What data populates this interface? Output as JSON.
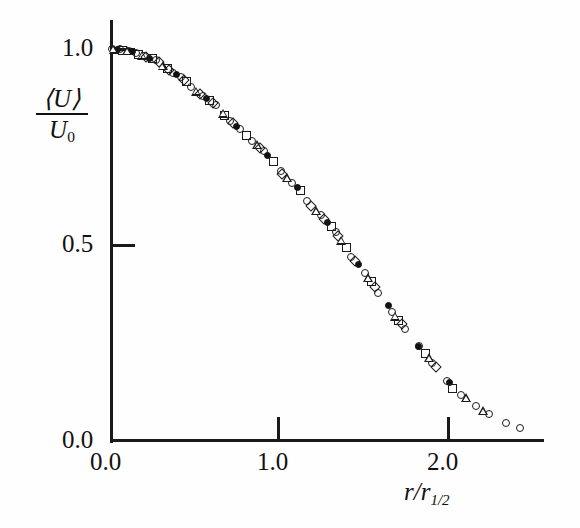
{
  "figure": {
    "kind": "scatter-plot",
    "background": "#fefefe",
    "ink_color": "#1a1a1a"
  },
  "axes": {
    "x_title": "r/r",
    "x_title_sub": "1/2",
    "y_title_numerator": "⟨U⟩",
    "y_title_denominator": "U",
    "y_title_den_sub": "0",
    "x_ticks": [
      "0.0",
      "1.0",
      "2.0"
    ],
    "y_ticks": [
      "0.0",
      "0.5",
      "1.0"
    ]
  },
  "chart_data": {
    "type": "scatter",
    "title": "",
    "xlabel": "r/r_1/2",
    "ylabel": "<U>/U_0",
    "xlim": [
      0.0,
      2.5
    ],
    "ylim": [
      0.0,
      1.05
    ],
    "grid": false,
    "legend": "none",
    "x_ticks": [
      0.0,
      1.0,
      2.0
    ],
    "y_ticks": [
      0.0,
      0.5,
      1.0
    ],
    "series": [
      {
        "name": "open-circle",
        "marker": "circle-open",
        "points": [
          [
            0.0,
            1.0
          ],
          [
            0.05,
            0.999
          ],
          [
            0.1,
            0.995
          ],
          [
            0.14,
            0.99
          ],
          [
            0.19,
            0.982
          ],
          [
            0.26,
            0.973
          ],
          [
            0.36,
            0.94
          ],
          [
            0.41,
            0.928
          ],
          [
            0.47,
            0.902
          ],
          [
            0.54,
            0.88
          ],
          [
            0.62,
            0.857
          ],
          [
            0.7,
            0.817
          ],
          [
            0.76,
            0.795
          ],
          [
            0.83,
            0.766
          ],
          [
            0.9,
            0.74
          ],
          [
            1.0,
            0.688
          ],
          [
            1.07,
            0.659
          ],
          [
            1.16,
            0.612
          ],
          [
            1.24,
            0.576
          ],
          [
            1.33,
            0.532
          ],
          [
            1.42,
            0.47
          ],
          [
            1.5,
            0.428
          ],
          [
            1.58,
            0.378
          ],
          [
            1.66,
            0.33
          ],
          [
            1.74,
            0.286
          ],
          [
            1.82,
            0.243
          ],
          [
            1.9,
            0.198
          ],
          [
            1.99,
            0.152
          ],
          [
            2.07,
            0.118
          ],
          [
            2.16,
            0.09
          ],
          [
            2.24,
            0.068
          ],
          [
            2.34,
            0.046
          ],
          [
            2.42,
            0.033
          ]
        ]
      },
      {
        "name": "filled-circle",
        "marker": "circle-fill",
        "points": [
          [
            0.03,
            0.999
          ],
          [
            0.12,
            0.993
          ],
          [
            0.22,
            0.977
          ],
          [
            0.38,
            0.934
          ],
          [
            0.56,
            0.874
          ],
          [
            0.74,
            0.802
          ],
          [
            0.92,
            0.729
          ],
          [
            1.1,
            0.646
          ],
          [
            1.28,
            0.558
          ],
          [
            1.46,
            0.451
          ],
          [
            1.64,
            0.346
          ],
          [
            1.82,
            0.24
          ],
          [
            2.0,
            0.148
          ]
        ]
      },
      {
        "name": "open-square",
        "marker": "square-open",
        "points": [
          [
            0.06,
            0.997
          ],
          [
            0.16,
            0.987
          ],
          [
            0.24,
            0.975
          ],
          [
            0.33,
            0.95
          ],
          [
            0.44,
            0.916
          ],
          [
            0.58,
            0.868
          ],
          [
            0.67,
            0.83
          ],
          [
            0.8,
            0.78
          ],
          [
            0.96,
            0.712
          ],
          [
            1.12,
            0.64
          ],
          [
            1.3,
            0.548
          ],
          [
            1.39,
            0.494
          ],
          [
            1.54,
            0.406
          ],
          [
            1.7,
            0.308
          ],
          [
            1.86,
            0.222
          ],
          [
            2.02,
            0.133
          ]
        ]
      },
      {
        "name": "open-triangle",
        "marker": "triangle-open",
        "points": [
          [
            0.01,
            1.0
          ],
          [
            0.09,
            0.996
          ],
          [
            0.18,
            0.984
          ],
          [
            0.3,
            0.958
          ],
          [
            0.5,
            0.892
          ],
          [
            0.66,
            0.836
          ],
          [
            0.86,
            0.756
          ],
          [
            1.04,
            0.672
          ],
          [
            1.21,
            0.588
          ],
          [
            1.36,
            0.512
          ],
          [
            1.52,
            0.417
          ],
          [
            1.68,
            0.318
          ],
          [
            1.88,
            0.212
          ],
          [
            2.1,
            0.11
          ],
          [
            2.2,
            0.078
          ]
        ]
      },
      {
        "name": "open-diamond",
        "marker": "diamond-open",
        "points": [
          [
            0.2,
            0.98
          ],
          [
            0.28,
            0.966
          ],
          [
            0.34,
            0.946
          ],
          [
            0.43,
            0.92
          ],
          [
            0.52,
            0.886
          ],
          [
            0.6,
            0.862
          ],
          [
            0.72,
            0.81
          ],
          [
            0.88,
            0.748
          ],
          [
            1.01,
            0.682
          ],
          [
            1.18,
            0.6
          ],
          [
            1.26,
            0.566
          ],
          [
            1.34,
            0.524
          ],
          [
            1.44,
            0.46
          ],
          [
            1.56,
            0.392
          ],
          [
            1.72,
            0.298
          ],
          [
            1.92,
            0.19
          ]
        ]
      }
    ]
  },
  "geometry": {
    "origin_x_px": 112,
    "origin_y_px": 441,
    "px_per_x_unit": 168.5,
    "px_per_y_unit": 392
  }
}
